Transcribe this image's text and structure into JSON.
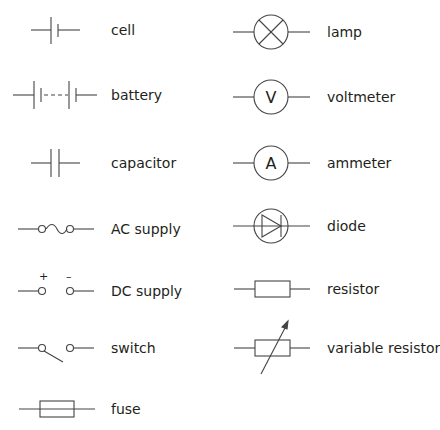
{
  "colors": {
    "stroke": "#444444",
    "text": "#231f20",
    "background": "#ffffff"
  },
  "symbols": [
    {
      "id": "cell",
      "label": "cell",
      "column": "left"
    },
    {
      "id": "battery",
      "label": "battery",
      "column": "left"
    },
    {
      "id": "capacitor",
      "label": "capacitor",
      "column": "left"
    },
    {
      "id": "ac-supply",
      "label": "AC supply",
      "column": "left"
    },
    {
      "id": "dc-supply",
      "label": "DC supply",
      "column": "left",
      "terminals": [
        "+",
        "–"
      ]
    },
    {
      "id": "switch",
      "label": "switch",
      "column": "left"
    },
    {
      "id": "fuse",
      "label": "fuse",
      "column": "left"
    },
    {
      "id": "lamp",
      "label": "lamp",
      "column": "right"
    },
    {
      "id": "voltmeter",
      "label": "voltmeter",
      "column": "right",
      "glyph": "V"
    },
    {
      "id": "ammeter",
      "label": "ammeter",
      "column": "right",
      "glyph": "A"
    },
    {
      "id": "diode",
      "label": "diode",
      "column": "right"
    },
    {
      "id": "resistor",
      "label": "resistor",
      "column": "right"
    },
    {
      "id": "variable-resistor",
      "label": "variable resistor",
      "column": "right"
    }
  ]
}
